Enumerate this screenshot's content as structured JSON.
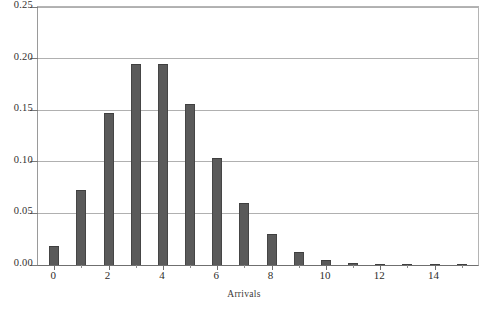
{
  "chart_data": {
    "type": "bar",
    "title": "",
    "xlabel": "Arrivals",
    "ylabel": "",
    "categories": [
      0,
      1,
      2,
      3,
      4,
      5,
      6,
      7,
      8,
      9,
      10,
      11,
      12,
      13,
      14,
      15
    ],
    "values": [
      0.018,
      0.073,
      0.147,
      0.195,
      0.195,
      0.156,
      0.104,
      0.06,
      0.03,
      0.013,
      0.005,
      0.002,
      0.001,
      0.0,
      0.0,
      0.0
    ],
    "xlim": [
      -0.6,
      15.6
    ],
    "ylim": [
      0.0,
      0.25
    ],
    "ytick_values": [
      0.0,
      0.05,
      0.1,
      0.15,
      0.2,
      0.25
    ],
    "ytick_labels": [
      "0.00",
      "0.05",
      "0.10",
      "0.15",
      "0.20",
      "0.25"
    ],
    "xtick_values": [
      0,
      2,
      4,
      6,
      8,
      10,
      12,
      14
    ],
    "xtick_labels": [
      "0",
      "2",
      "4",
      "6",
      "8",
      "10",
      "12",
      "14"
    ],
    "xtick_minor_values": [
      1,
      3,
      5,
      7,
      9,
      11,
      13,
      15
    ],
    "grid": "horizontal",
    "legend": "none",
    "bar_color": "#5a5a5a",
    "grid_color": "#b0b0b0",
    "axis_color": "#6f6f6f",
    "background": "#ffffff"
  }
}
